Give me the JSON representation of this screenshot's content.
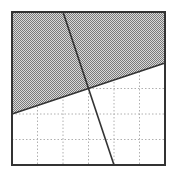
{
  "diagram": {
    "type": "linear-inequality-region",
    "box": {
      "x": 12,
      "y": 12,
      "width": 153,
      "height": 153,
      "stroke": "#333333",
      "stroke_width": 2
    },
    "grid": {
      "divisions": 6,
      "lines_x": [
        37.5,
        63,
        88.5,
        114,
        139.5
      ],
      "lines_y": [
        37.5,
        63,
        88.5,
        114,
        139.5
      ],
      "style": "dotted",
      "color": "#b0b0b0"
    },
    "lines": [
      {
        "name": "steep-line",
        "x1": 63,
        "y1": 12,
        "x2": 114,
        "y2": 165,
        "color": "#333333",
        "width": 1.6
      },
      {
        "name": "shallow-line",
        "x1": 12,
        "y1": 114,
        "x2": 165,
        "y2": 63,
        "color": "#333333",
        "width": 1.6
      }
    ],
    "shaded_region": {
      "description": "region above the shallow line",
      "points": "12,12 165,12 165,63 12,114",
      "pattern": "checker-dots",
      "fg_color": "#7a7a7a",
      "bg_color": "#d9d9d9"
    },
    "intersection": {
      "x": 88.5,
      "y": 88.5
    }
  }
}
